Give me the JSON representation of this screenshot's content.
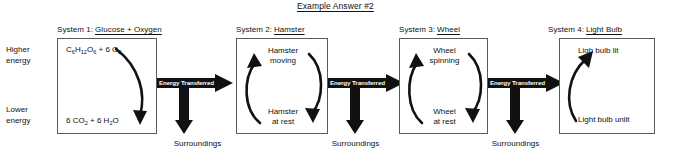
{
  "title": "Example Answer #2",
  "energy_axis": {
    "higher_line1": "Higher",
    "higher_line2": "energy",
    "lower_line1": "Lower",
    "lower_line2": "energy"
  },
  "systems": [
    {
      "prefix": "System 1:",
      "name": "Glucose + Oxygen",
      "top_label": "C6H12O6 + 6 O2",
      "bottom_label": "6 CO2 + 6 H2O",
      "arrow_style": "down-curve"
    },
    {
      "prefix": "System 2:",
      "name": "Hamster",
      "top_line1": "Hamster",
      "top_line2": "moving",
      "bottom_line1": "Hamster",
      "bottom_line2": "at rest",
      "arrow_style": "cycle"
    },
    {
      "prefix": "System 3:",
      "name": "Wheel",
      "top_line1": "Wheel",
      "top_line2": "spinning",
      "bottom_line1": "Wheel",
      "bottom_line2": "at rest",
      "arrow_style": "cycle"
    },
    {
      "prefix": "System 4:",
      "name": "Light Bulb",
      "top_label": "Ligh bulb lit",
      "bottom_label": "Light bulb unlit",
      "arrow_style": "up-curve"
    }
  ],
  "transfers": [
    {
      "label": "Energy Transferred",
      "sink_label": "Surroundings"
    },
    {
      "label": "Energy Transferred",
      "sink_label": "Surroundings"
    },
    {
      "label": "Energy Transferred",
      "sink_label": "Surroundings"
    }
  ],
  "colors": {
    "arrow_black": "#111111",
    "box_border": "#5a5a5a",
    "text": "#111111",
    "label_text_on_arrow": "#ffffff",
    "background": "#ffffff"
  }
}
